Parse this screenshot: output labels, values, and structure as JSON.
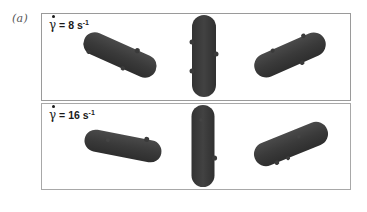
{
  "figure": {
    "label": "(a)",
    "colors": {
      "rod_fill": "#3d3d3d",
      "rod_edge": "#2a2a2a",
      "panel_border": "#9a9a9a",
      "background": "#ffffff"
    }
  },
  "panels": [
    {
      "id": "top",
      "symbol": "γ",
      "equals": "=",
      "value": "8",
      "unit": "s",
      "exponent": "-1",
      "rods": [
        {
          "position": "left",
          "orientation": "tilted down-right"
        },
        {
          "position": "center",
          "orientation": "vertical"
        },
        {
          "position": "right",
          "orientation": "tilted up-right"
        }
      ]
    },
    {
      "id": "bottom",
      "symbol": "γ",
      "equals": "=",
      "value": "16",
      "unit": "s",
      "exponent": "-1",
      "rods": [
        {
          "position": "left",
          "orientation": "slightly tilted down-right"
        },
        {
          "position": "center",
          "orientation": "vertical"
        },
        {
          "position": "right",
          "orientation": "tilted up-right"
        }
      ]
    }
  ]
}
